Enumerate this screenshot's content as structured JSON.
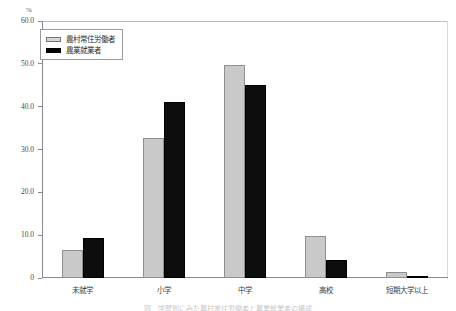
{
  "figure": {
    "unit_label": "%",
    "caption": "図　学歴別にみた農村常住労働者と農業就業者の構成"
  },
  "legend": {
    "position": "top-left",
    "items": [
      {
        "label": "農村常住労働者",
        "swatch": "light-swatch",
        "color": "#d6d6d6"
      },
      {
        "label": "農業就業者",
        "swatch": "dark-swatch",
        "color": "#000000"
      }
    ]
  },
  "chart_data": {
    "type": "bar",
    "title": "",
    "xlabel": "",
    "ylabel": "%",
    "ylim": [
      0,
      60
    ],
    "yticks": [
      "0",
      "10.0",
      "20.0",
      "30.0",
      "40.0",
      "50.0",
      "60.0"
    ],
    "ytick_values": [
      0,
      10,
      20,
      30,
      40,
      50,
      60
    ],
    "grid": false,
    "legend_position": "upper left",
    "categories": [
      "未就学",
      "小学",
      "中学",
      "高校",
      "短期大学以上"
    ],
    "series": [
      {
        "name": "農村常住労働者",
        "color": "#c9c9c9",
        "values": [
          6.6,
          32.6,
          49.8,
          9.7,
          1.3
        ]
      },
      {
        "name": "農業就業者",
        "color": "#0d0d0d",
        "values": [
          9.3,
          41.0,
          45.0,
          4.2,
          0.4
        ]
      }
    ]
  }
}
